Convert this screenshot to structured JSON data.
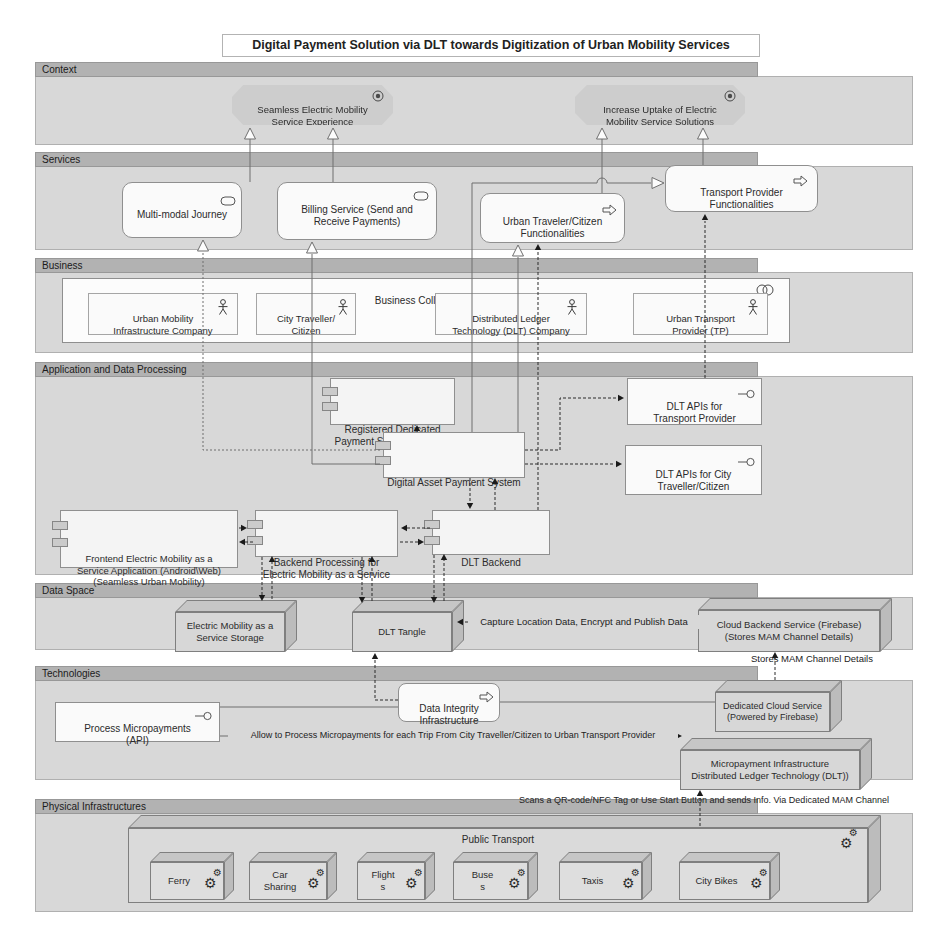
{
  "title": "Digital Payment Solution via DLT towards Digitization of Urban Mobility Services",
  "layers": {
    "context": "Context",
    "services": "Services",
    "business": "Business",
    "application": "Application and Data Processing",
    "data_space": "Data Space",
    "technologies": "Technologies",
    "physical": "Physical Infrastructures"
  },
  "context": {
    "goal_seamless": "Seamless Electric Mobility\nService Experience",
    "goal_uptake": "Increase Uptake of Electric\nMobility Service Solutions"
  },
  "services": {
    "multimodal": "Multi-modal Journey",
    "billing": "Billing Service (Send and\nReceive Payments)",
    "urban_traveler_func": "Urban Traveler/Citizen\nFunctionalities",
    "transport_provider_func": "Transport Provider\nFunctionalities"
  },
  "business": {
    "collaboration": "Business Collaboration",
    "actors": [
      "Urban Mobility\nInfrastructure Company",
      "City Traveller/\nCitizen",
      "Distributed Ledger\nTechnology (DLT) Company",
      "Urban Transport\nProvider (TP)"
    ]
  },
  "application": {
    "terminal": "Registered Dedicated\nPayment System Terminal",
    "daps": "Digital Asset Payment System",
    "dlt_api_tp": "DLT APIs for\nTransport Provider",
    "dlt_api_citizen": "DLT APIs for City\nTraveller/Citizen",
    "frontend": "Frontend Electric Mobility as a\nService Application (Android\\Web)\n(Seamless Urban Mobility)",
    "backend": "Backend Processing for\nElectric Mobility as a Service",
    "dlt_backend": "DLT Backend"
  },
  "data_space": {
    "storage": "Electric Mobility as a\nService Storage",
    "tangle": "DLT Tangle",
    "capture_note": "Capture Location Data, Encrypt and Publish Data",
    "cloud_backend": "Cloud Backend Service (Firebase)\n(Stores MAM Channel Details)",
    "stores_mam_note": "Stores MAM Channel Details"
  },
  "technologies": {
    "process_micropayments": "Process Micropayments\n(API)",
    "data_integrity": "Data Integrity\nInfrastructure",
    "dedicated_cloud": "Dedicated Cloud Service\n(Powered by Firebase)",
    "micropayment_infra": "Micropayment Infrastructure\nDistributed Ledger Technology (DLT))",
    "allow_note": "Allow to Process Micropayments for each Trip From City Traveller/Citizen to Urban Transport Provider"
  },
  "physical": {
    "scans_note": "Scans a QR-code/NFC Tag or Use Start Button and sends Info. Via Dedicated MAM Channel",
    "public_transport": "Public Transport",
    "modes": [
      "Ferry",
      "Car\nSharing",
      "Flight\ns",
      "Buse\ns",
      "Taxis",
      "City Bikes"
    ]
  }
}
